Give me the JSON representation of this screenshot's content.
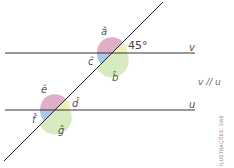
{
  "diagram": {
    "lines": {
      "v": {
        "label": "v"
      },
      "u": {
        "label": "u"
      }
    },
    "relation": "v // u",
    "angles": {
      "a": "â",
      "b": "b̂",
      "c": "ĉ",
      "d": "d̂",
      "e": "ê",
      "f": "f̂",
      "g": "ĝ"
    },
    "given_angle": "45°",
    "colors": {
      "red_sector": "#d9a0bd",
      "yellow_sector": "#eef0b0",
      "green_sector": "#cfe8b4",
      "blue_sector": "#9fc3e6",
      "line": "#333333"
    },
    "credit": "ILUSTRAÇÕES: DAE"
  }
}
